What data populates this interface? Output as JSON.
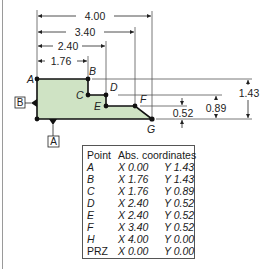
{
  "figure": {
    "fill_color": "#cfe3c4",
    "outline_color": "#111111",
    "dimensions": {
      "horizontal": [
        {
          "label": "4.00",
          "to_point": "G"
        },
        {
          "label": "3.40",
          "to_point": "F"
        },
        {
          "label": "2.40",
          "to_point": "D/E"
        },
        {
          "label": "1.76",
          "to_point": "B/C"
        }
      ],
      "vertical": [
        {
          "label": "1.43",
          "from_point": "A/B"
        },
        {
          "label": "0.89",
          "from_point": "C/D"
        },
        {
          "label": "0.52",
          "from_point": "E/F"
        }
      ]
    },
    "point_labels": {
      "A": "A",
      "B": "B",
      "C": "C",
      "D": "D",
      "E": "E",
      "F": "F",
      "G": "G"
    },
    "datums": {
      "A": "A",
      "B": "B"
    }
  },
  "table": {
    "headers": {
      "point": "Point",
      "coords": "Abs. coordinates"
    },
    "rows": [
      {
        "point": "A",
        "x": "X 0.00",
        "y": "Y 1.43"
      },
      {
        "point": "B",
        "x": "X 1.76",
        "y": "Y 1.43"
      },
      {
        "point": "C",
        "x": "X 1.76",
        "y": "Y 0.89"
      },
      {
        "point": "D",
        "x": "X 2.40",
        "y": "Y 0.52"
      },
      {
        "point": "E",
        "x": "X 2.40",
        "y": "Y 0.52"
      },
      {
        "point": "F",
        "x": "X 3.40",
        "y": "Y 0.52"
      },
      {
        "point": "H",
        "x": "X 4.00",
        "y": "Y 0.00"
      },
      {
        "point": "PRZ",
        "x": "X 0.00",
        "y": "Y 0.00"
      }
    ]
  }
}
